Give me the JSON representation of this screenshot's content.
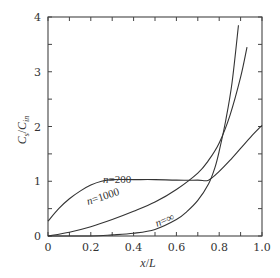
{
  "chart_data": {
    "type": "line",
    "title": "",
    "xlabel": "x/L",
    "ylabel": "C_s/C_in",
    "xlim": [
      0,
      1.0
    ],
    "ylim": [
      0,
      4
    ],
    "grid": false,
    "legend": "inline curve labels",
    "x_ticks": [
      "0",
      "0.2",
      "0.4",
      "0.6",
      "0.8",
      "1.0"
    ],
    "y_ticks": [
      "0",
      "1",
      "2",
      "3",
      "4"
    ],
    "series": [
      {
        "name": "n=200",
        "label": "n=200",
        "x": [
          0,
          0.05,
          0.1,
          0.15,
          0.2,
          0.25,
          0.3,
          0.4,
          0.5,
          0.6,
          0.7,
          0.75,
          0.8,
          0.85,
          0.9,
          0.95,
          1.0
        ],
        "y": [
          0.27,
          0.5,
          0.68,
          0.82,
          0.93,
          1.0,
          1.03,
          1.03,
          1.03,
          1.02,
          1.02,
          1.02,
          1.18,
          1.38,
          1.6,
          1.82,
          2.02
        ]
      },
      {
        "name": "n=1000",
        "label": "n=1000",
        "x": [
          0,
          0.1,
          0.2,
          0.3,
          0.4,
          0.5,
          0.6,
          0.7,
          0.75,
          0.8,
          0.85,
          0.9,
          0.93
        ],
        "y": [
          0,
          0.07,
          0.17,
          0.3,
          0.45,
          0.62,
          0.85,
          1.15,
          1.38,
          1.7,
          2.2,
          2.9,
          3.45
        ]
      },
      {
        "name": "n=∞",
        "label": "n=∞",
        "x": [
          0,
          0.2,
          0.3,
          0.4,
          0.5,
          0.6,
          0.65,
          0.7,
          0.75,
          0.78,
          0.8,
          0.83,
          0.86,
          0.89
        ],
        "y": [
          0,
          0.0,
          0.02,
          0.05,
          0.12,
          0.3,
          0.45,
          0.65,
          0.95,
          1.25,
          1.55,
          2.1,
          2.8,
          3.85
        ]
      }
    ]
  },
  "labels": {
    "xlabel_x": "x",
    "xlabel_sep": "/",
    "xlabel_L": "L",
    "ylabel_C": "C",
    "ylabel_s": "s",
    "ylabel_sep": "/",
    "ylabel_C2": "C",
    "ylabel_in": "in",
    "n200": "n=200",
    "n1000": "n=1000",
    "ninf": "n=∞"
  }
}
